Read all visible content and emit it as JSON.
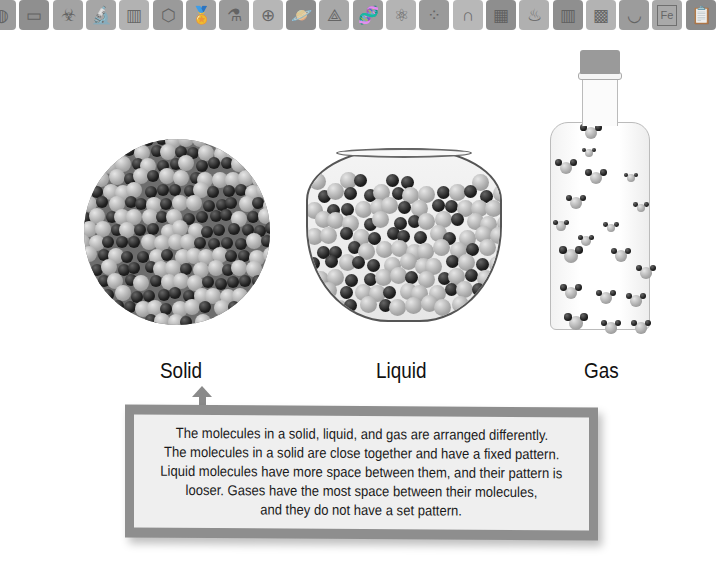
{
  "toolbar": {
    "tiles": [
      {
        "icon": "microorganism-icon",
        "glyph": "◍",
        "x": -14,
        "color": "#9c9c9c"
      },
      {
        "icon": "chalkboard-icon",
        "glyph": "▭",
        "x": 19,
        "color": "#8f8f8f"
      },
      {
        "icon": "biohazard-icon",
        "glyph": "☣",
        "x": 53,
        "color": "#a3a3a3"
      },
      {
        "icon": "microscope-icon",
        "glyph": "🔬",
        "x": 86,
        "color": "#a6a6a6"
      },
      {
        "icon": "test-tubes-chart-icon",
        "glyph": "▥",
        "x": 119,
        "color": "#b2b2b2"
      },
      {
        "icon": "hexagon-molecule-icon",
        "glyph": "⬡",
        "x": 153,
        "color": "#9a9a9a"
      },
      {
        "icon": "award-ribbon-icon",
        "glyph": "🏅",
        "x": 186,
        "color": "#a2a2a2"
      },
      {
        "icon": "dropper-bottle-icon",
        "glyph": "⚗",
        "x": 219,
        "color": "#9a9a9a"
      },
      {
        "icon": "magnifier-plus-icon",
        "glyph": "⊕",
        "x": 253,
        "color": "#b6b6b6"
      },
      {
        "icon": "planet-icon",
        "glyph": "🪐",
        "x": 286,
        "color": "#8c8c8c"
      },
      {
        "icon": "molecule-bond-icon",
        "glyph": "⟁",
        "x": 319,
        "color": "#a8a8a8"
      },
      {
        "icon": "dna-icon",
        "glyph": "🧬",
        "x": 353,
        "color": "#9d9d9d"
      },
      {
        "icon": "atom-icon",
        "glyph": "⚛",
        "x": 386,
        "color": "#b4b4b4"
      },
      {
        "icon": "particles-icon",
        "glyph": "⁘",
        "x": 419,
        "color": "#9a9a9a"
      },
      {
        "icon": "magnet-icon",
        "glyph": "∩",
        "x": 453,
        "color": "#b8b8b8"
      },
      {
        "icon": "calculator-icon",
        "glyph": "▦",
        "x": 486,
        "color": "#8e8e8e"
      },
      {
        "icon": "bunsen-burner-icon",
        "glyph": "♨",
        "x": 519,
        "color": "#b0b0b0"
      },
      {
        "icon": "test-tube-rack-icon",
        "glyph": "▥",
        "x": 553,
        "color": "#8f8f8f"
      },
      {
        "icon": "petri-grid-icon",
        "glyph": "▩",
        "x": 586,
        "color": "#b3b3b3"
      },
      {
        "icon": "mortar-pestle-icon",
        "glyph": "◡",
        "x": 619,
        "color": "#9c9c9c"
      },
      {
        "icon": "periodic-element-fe-icon",
        "glyph": "Fe",
        "x": 652,
        "color": "#a9a9a9"
      },
      {
        "icon": "clipboard-icon",
        "glyph": "📋",
        "x": 686,
        "color": "#8a8a8a"
      }
    ]
  },
  "states": {
    "solid": {
      "label": "Solid",
      "label_x": 160
    },
    "liquid": {
      "label": "Liquid",
      "label_x": 376
    },
    "gas": {
      "label": "Gas",
      "label_x": 584
    }
  },
  "callout": {
    "lines": [
      "The molecules in a solid, liquid, and gas are arranged differently.",
      "The molecules in a solid are close together and have a fixed pattern.",
      "Liquid molecules have more space between them, and their pattern is",
      "looser. Gases have the most space between their molecules,",
      "and they do not have a set pattern."
    ]
  },
  "colors": {
    "callout_border": "#8e8e8e",
    "callout_fill": "#efefef",
    "text": "#111111"
  }
}
